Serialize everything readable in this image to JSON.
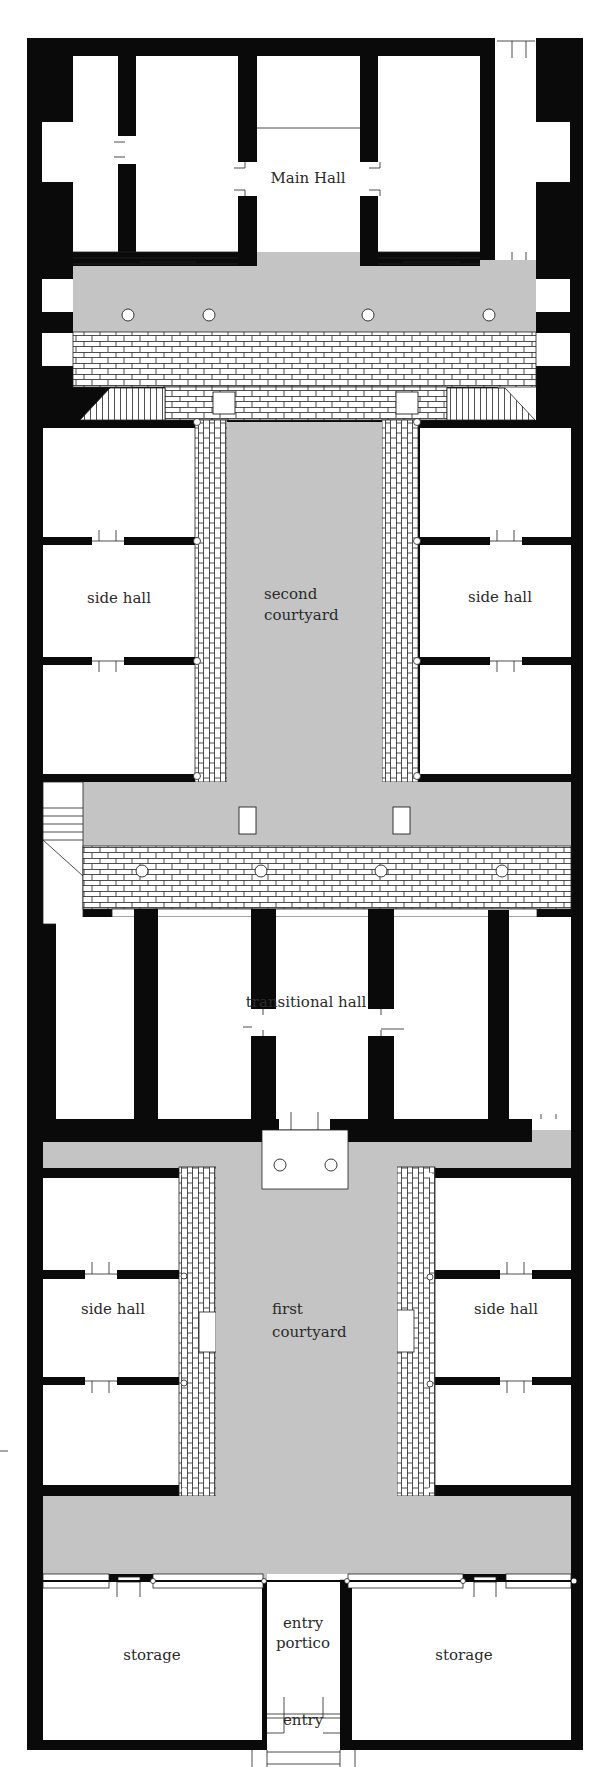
{
  "colors": {
    "wall": "#0a0a0a",
    "gray_floor": "#c4c4c4",
    "paving_fill": "#ffffff",
    "paving_line": "#222222",
    "room": "#ffffff",
    "text": "#2a2a2a"
  },
  "labels": {
    "main_hall": "Main Hall",
    "side_hall_upper_left": "side hall",
    "side_hall_upper_right": "side hall",
    "second_courtyard_line1": "second",
    "second_courtyard_line2": "courtyard",
    "transitional_hall": "transitional hall",
    "side_hall_lower_left": "side hall",
    "side_hall_lower_right": "side hall",
    "first_courtyard_line1": "first",
    "first_courtyard_line2": "courtyard",
    "storage_left": "storage",
    "storage_right": "storage",
    "entry_portico_line1": "entry",
    "entry_portico_line2": "portico",
    "entry": "entry"
  },
  "columns": {
    "main_portico": [
      [
        128,
        315
      ],
      [
        209,
        315
      ],
      [
        368,
        315
      ],
      [
        489,
        315
      ]
    ],
    "middle_portico": [
      [
        142,
        871
      ],
      [
        261,
        871
      ],
      [
        381,
        871
      ],
      [
        502,
        871
      ]
    ],
    "altar": [
      [
        280,
        1165
      ],
      [
        331,
        1165
      ]
    ]
  },
  "pillars": {
    "main_paving": [
      [
        213,
        392,
        22,
        22
      ],
      [
        396,
        392,
        22,
        22
      ]
    ],
    "middle_gray": [
      [
        239,
        807,
        17,
        27
      ],
      [
        393,
        807,
        17,
        27
      ]
    ]
  }
}
